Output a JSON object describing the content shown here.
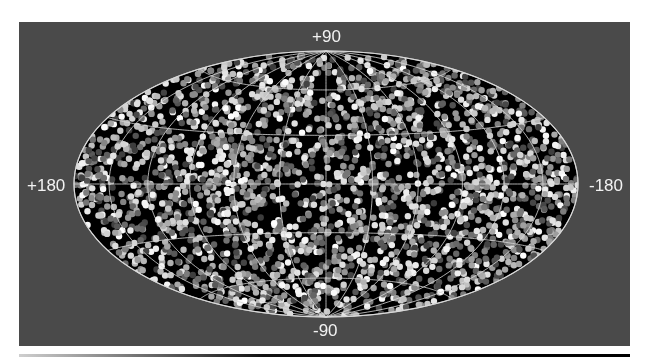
{
  "chart_data": {
    "type": "scatter",
    "projection": "Hammer-Aitoff (all-sky, ellipse)",
    "title": "",
    "xlabel": "",
    "ylabel": "",
    "axis_labels": {
      "top": "+90",
      "bottom": "-90",
      "left": "+180",
      "right": "-180"
    },
    "xlim": [
      180,
      -180
    ],
    "ylim": [
      -90,
      90
    ],
    "grid": {
      "meridian_step_deg": 30,
      "parallel_step_deg": 30,
      "color": "#d8d8d8"
    },
    "legend": null,
    "points": {
      "count_approx": 2500,
      "distribution": "roughly uniform over the sphere",
      "marker": "filled circle",
      "colors": "grayscale, from dark gray to white"
    },
    "colors": {
      "panel_background": "#4a4a4a",
      "sky_background": "#000000",
      "grid_lines": "#d8d8d8",
      "label_text": "#f2f2f2"
    }
  }
}
